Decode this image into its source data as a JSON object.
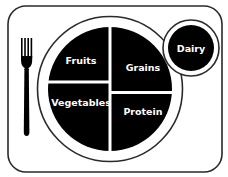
{
  "diagram": {
    "type": "myplate",
    "colors": {
      "background": "#ffffff",
      "stroke": "#1a1a1a",
      "fill": "#000000",
      "label": "#ffffff"
    },
    "placemat": {
      "x": 8,
      "y": 6,
      "width": 214,
      "height": 166,
      "corner_radius": 18
    },
    "fork": {
      "icon": "fork-icon"
    },
    "plate": {
      "cx": 110,
      "cy": 89,
      "outer_radius": 73,
      "inner_radius": 62,
      "sections": [
        {
          "id": "fruits",
          "label": "Fruits"
        },
        {
          "id": "grains",
          "label": "Grains"
        },
        {
          "id": "vegetables",
          "label": "Vegetables"
        },
        {
          "id": "protein",
          "label": "Protein"
        }
      ]
    },
    "cup": {
      "cx": 191,
      "cy": 48,
      "outer_radius": 28,
      "inner_radius": 23,
      "label": "Dairy"
    }
  }
}
